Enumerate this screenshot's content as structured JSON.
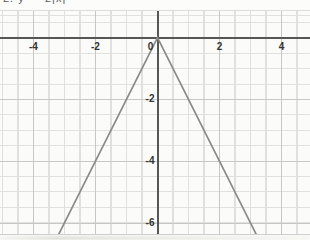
{
  "title_cropped": "2.  y = -2|x|",
  "chart_data": {
    "type": "line",
    "title": "2.  y = -2|x|",
    "equation": "y = -2|x|",
    "vertex": [
      0,
      0
    ],
    "slope_magnitude": 2,
    "series": [
      {
        "name": "y = -2|x|",
        "points": [
          [
            -3.25,
            -6.5
          ],
          [
            0,
            0
          ],
          [
            3.25,
            -6.5
          ]
        ]
      }
    ],
    "x_ticks": [
      -4,
      -2,
      0,
      2,
      4
    ],
    "y_ticks": [
      -2,
      -4,
      -6
    ],
    "x_range": [
      -5.08,
      4.92
    ],
    "y_range": [
      -6.36,
      0.86
    ],
    "grid": true,
    "grid_minor_step": 0.5,
    "grid_major_step": 2,
    "legend": "none",
    "colors": {
      "line": "#8a8a88",
      "axis": "#565654",
      "grid_minor": "#e0e0de",
      "grid_major": "#c7c7c5",
      "tick_label": "#333330",
      "background": "#fbfbf9"
    }
  }
}
